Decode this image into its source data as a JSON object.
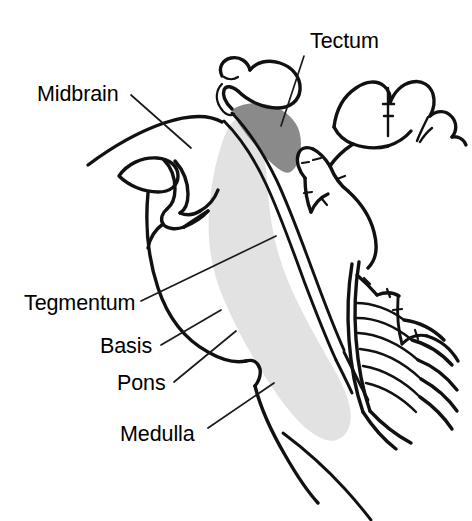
{
  "figure": {
    "background_color": "#ffffff",
    "width": 472,
    "height": 521
  },
  "colors": {
    "outline": "#111111",
    "tectum_fill": "#8a8a8a",
    "tegmentum_band_fill": "#e2e2e2",
    "leader_line": "#1a1a1a",
    "label_text": "#000000",
    "background": "#ffffff"
  },
  "labels": [
    {
      "id": "tectum",
      "text": "Tectum",
      "side": "right",
      "text_x": 310,
      "text_y": 48,
      "leader_from_x": 304,
      "leader_from_y": 56,
      "leader_to_x": 281,
      "leader_to_y": 126
    },
    {
      "id": "midbrain",
      "text": "Midbrain",
      "side": "left",
      "text_x": 37,
      "text_y": 101,
      "leader_from_x": 131,
      "leader_from_y": 95,
      "leader_to_x": 191,
      "leader_to_y": 148
    },
    {
      "id": "tegmentum",
      "text": "Tegmentum",
      "side": "left",
      "text_x": 24,
      "text_y": 310,
      "leader_from_x": 141,
      "leader_from_y": 301,
      "leader_to_x": 276,
      "leader_to_y": 236
    },
    {
      "id": "basis",
      "text": "Basis",
      "side": "left",
      "text_x": 100,
      "text_y": 353,
      "leader_from_x": 161,
      "leader_from_y": 345,
      "leader_to_x": 221,
      "leader_to_y": 310
    },
    {
      "id": "pons",
      "text": "Pons",
      "side": "left",
      "text_x": 117,
      "text_y": 390,
      "leader_from_x": 174,
      "leader_from_y": 382,
      "leader_to_x": 236,
      "leader_to_y": 331
    },
    {
      "id": "medulla",
      "text": "Medulla",
      "side": "left",
      "text_x": 120,
      "text_y": 441,
      "leader_from_x": 208,
      "leader_from_y": 428,
      "leader_to_x": 274,
      "leader_to_y": 383
    }
  ],
  "regions": [
    {
      "id": "tectum-region",
      "name": "Tectum (shaded dark gray)",
      "fill": "#8a8a8a"
    },
    {
      "id": "tegmentum-band-region",
      "name": "Tegmentum band (shaded light gray)",
      "fill": "#e2e2e2"
    },
    {
      "id": "brainstem-outline",
      "name": "Brainstem outline",
      "fill": "none"
    },
    {
      "id": "cerebellum-upper",
      "name": "Upper cerebellar folia",
      "fill": "none"
    },
    {
      "id": "cerebellum-lower",
      "name": "Lower cerebellar folia (arbor vitae)",
      "fill": "none"
    },
    {
      "id": "optic-chiasm",
      "name": "Optic chiasm and pituitary stalk",
      "fill": "none"
    },
    {
      "id": "corpus-callosum",
      "name": "Corpus callosum / fornix region",
      "fill": "none"
    }
  ]
}
